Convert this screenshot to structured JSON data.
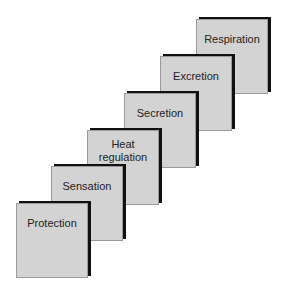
{
  "diagram": {
    "type": "staircase",
    "steps": [
      {
        "label": "Protection",
        "lines": [
          "Protection"
        ],
        "x": 16,
        "y": 203
      },
      {
        "label": "Sensation",
        "lines": [
          "Sensation"
        ],
        "x": 51,
        "y": 166
      },
      {
        "label": "Heat regulation",
        "lines": [
          "Heat",
          "regulation"
        ],
        "x": 87,
        "y": 130
      },
      {
        "label": "Secretion",
        "lines": [
          "Secretion"
        ],
        "x": 124,
        "y": 93
      },
      {
        "label": "Excretion",
        "lines": [
          "Excretion"
        ],
        "x": 160,
        "y": 56
      },
      {
        "label": "Respiration",
        "lines": [
          "Respiration"
        ],
        "x": 196,
        "y": 19
      }
    ],
    "colors": {
      "box_fill": "#d3d3d3",
      "shadow": "#111111",
      "text": "#222222"
    }
  }
}
